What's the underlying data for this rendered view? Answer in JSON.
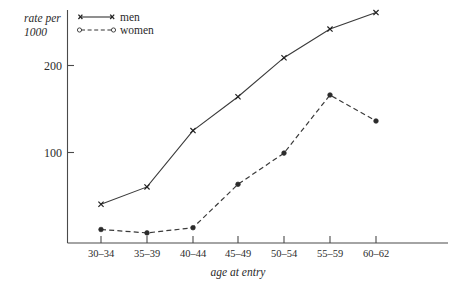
{
  "chart_data": {
    "type": "line",
    "title": "",
    "xlabel": "age at entry",
    "ylabel": "rate per 1000",
    "ylabel_line1": "rate per",
    "ylabel_line2": "1000",
    "categories": [
      "30–34",
      "35–39",
      "40–44",
      "45–49",
      "50–54",
      "55–59",
      "60–62"
    ],
    "series": [
      {
        "name": "men",
        "marker": "x",
        "linestyle": "solid",
        "color": "#2b2b2b",
        "values": [
          40,
          60,
          125,
          164,
          209,
          242,
          261
        ]
      },
      {
        "name": "women",
        "marker": "o",
        "linestyle": "dashed",
        "color": "#2b2b2b",
        "values": [
          11,
          7,
          13,
          63,
          99,
          166,
          136
        ]
      }
    ],
    "yticks": [
      100,
      200
    ],
    "ytick_labels": [
      "100",
      "200"
    ],
    "ylim": [
      0,
      285
    ],
    "grid": false,
    "legend_position": "top-left-inside",
    "legend": [
      {
        "label": "men",
        "marker": "x",
        "linestyle": "solid"
      },
      {
        "label": "women",
        "marker": "o",
        "linestyle": "dashed"
      }
    ]
  },
  "colors": {
    "ink": "#2b2b2b",
    "axis": "#4a4a4a",
    "background": "#ffffff"
  }
}
